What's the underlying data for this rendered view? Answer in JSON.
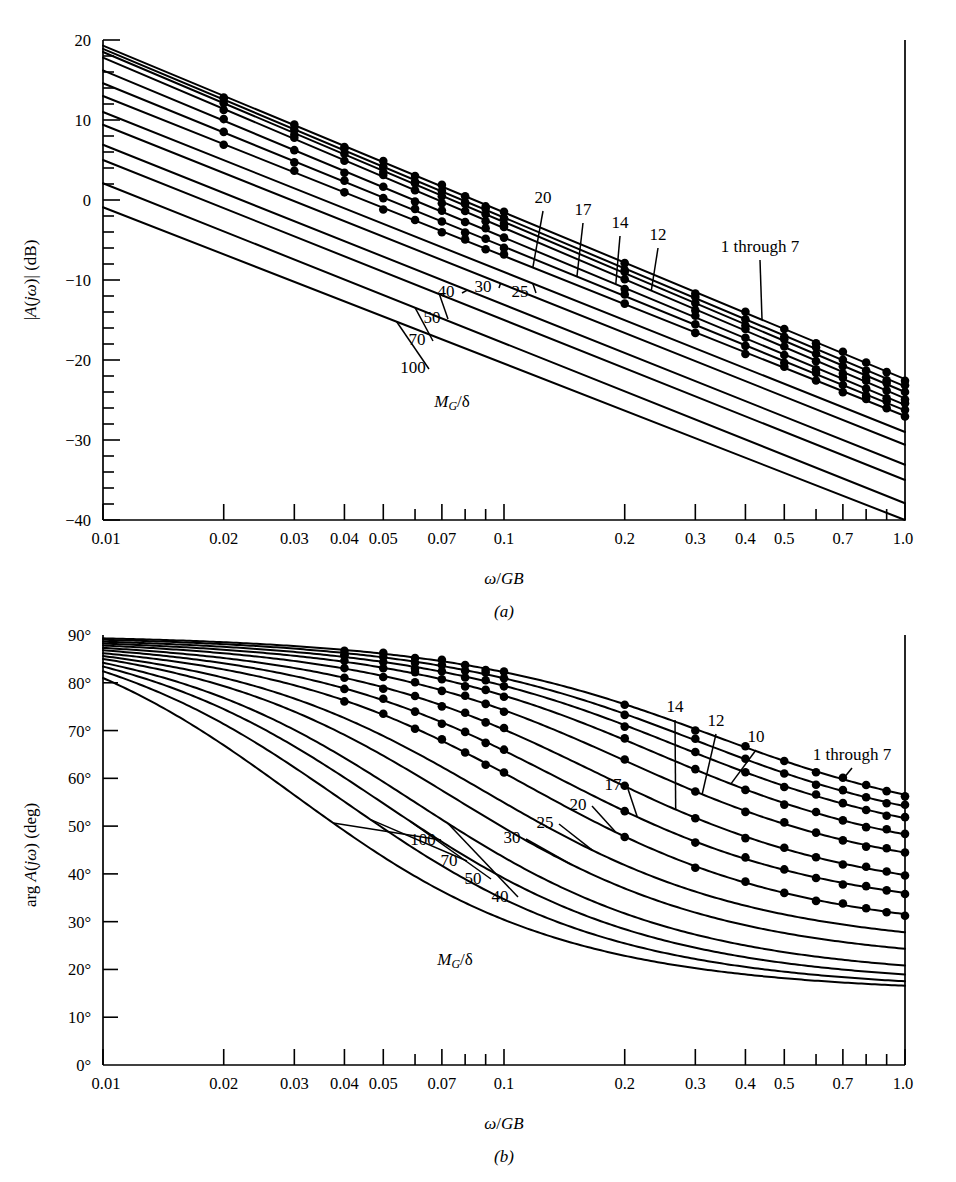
{
  "figure": {
    "panels": [
      {
        "id": "a",
        "caption": "(a)",
        "xlabel": "ω/GB",
        "ylabel": "|A(jω)| (dB)"
      },
      {
        "id": "b",
        "caption": "(b)",
        "xlabel": "ω/GB",
        "ylabel": "arg A(jω) (deg)"
      }
    ],
    "family_label": "M_G/δ",
    "family_label_parts": {
      "m": "M",
      "sub": "G",
      "slash": "/",
      "delta": "δ"
    }
  },
  "chart_data": [
    {
      "type": "line",
      "panel": "a",
      "title": "",
      "xlabel": "ω/GB",
      "ylabel": "|A(jω)| (dB)",
      "xscale": "log",
      "xlim": [
        0.01,
        1.0
      ],
      "ylim": [
        -40,
        20
      ],
      "grid": false,
      "legend": "inline-labels",
      "xticks": [
        0.01,
        0.02,
        0.03,
        0.04,
        0.05,
        0.07,
        0.1,
        0.2,
        0.3,
        0.4,
        0.5,
        0.7,
        1.0
      ],
      "xticklabels": [
        "0.01",
        "0.02",
        "0.03",
        "0.04",
        "0.05",
        "0.07",
        "0.1",
        "0.2",
        "0.3",
        "0.4",
        "0.5",
        "0.7",
        "1.0"
      ],
      "yticks": [
        20,
        10,
        0,
        -10,
        -20,
        -30,
        -40
      ],
      "yticklabels": [
        "20",
        "10",
        "0",
        "−10",
        "−20",
        "−30",
        "−40"
      ],
      "yminor_step": 2,
      "marker": "filled-circle",
      "marker_x": [
        0.02,
        0.03,
        0.04,
        0.05,
        0.06,
        0.07,
        0.08,
        0.09,
        0.1,
        0.2,
        0.3,
        0.4,
        0.5,
        0.6,
        0.7,
        0.8,
        0.9,
        1.0
      ],
      "annotations": [
        {
          "text": "20",
          "target_series": "20"
        },
        {
          "text": "17",
          "target_series": "17"
        },
        {
          "text": "14",
          "target_series": "14"
        },
        {
          "text": "12",
          "target_series": "12"
        },
        {
          "text": "1 through 7",
          "target_series": "1-7"
        },
        {
          "text": "25",
          "target_series": "25"
        },
        {
          "text": "30",
          "target_series": "30"
        },
        {
          "text": "40",
          "target_series": "40"
        },
        {
          "text": "50",
          "target_series": "50"
        },
        {
          "text": "70",
          "target_series": "70"
        },
        {
          "text": "100",
          "target_series": "100"
        },
        {
          "text": "M_G/δ",
          "target_series": null
        }
      ],
      "series": [
        {
          "name": "1-7",
          "y0_db": 19.3,
          "y1_db": -22.4,
          "markers": true
        },
        {
          "name": "1-7b",
          "y0_db": 18.9,
          "y1_db": -23.3,
          "markers": true
        },
        {
          "name": "1-7c",
          "y0_db": 18.5,
          "y1_db": -24.0,
          "markers": true
        },
        {
          "name": "12",
          "y0_db": 17.8,
          "y1_db": -24.8,
          "markers": true
        },
        {
          "name": "14",
          "y0_db": 16.2,
          "y1_db": -25.6,
          "markers": true
        },
        {
          "name": "17",
          "y0_db": 14.6,
          "y1_db": -26.3,
          "markers": true
        },
        {
          "name": "20",
          "y0_db": 13.0,
          "y1_db": -27.0,
          "markers": true
        },
        {
          "name": "25",
          "y0_db": 11.0,
          "y1_db": -29.0,
          "markers": false
        },
        {
          "name": "30",
          "y0_db": 9.4,
          "y1_db": -30.6,
          "markers": false
        },
        {
          "name": "40",
          "y0_db": 6.9,
          "y1_db": -33.1,
          "markers": false
        },
        {
          "name": "50",
          "y0_db": 5.0,
          "y1_db": -35.0,
          "markers": false
        },
        {
          "name": "70",
          "y0_db": 2.1,
          "y1_db": -37.9,
          "markers": false
        },
        {
          "name": "100",
          "y0_db": -0.9,
          "y1_db": -40.0,
          "markers": false
        }
      ]
    },
    {
      "type": "line",
      "panel": "b",
      "title": "",
      "xlabel": "ω/GB",
      "ylabel": "arg A(jω) (deg)",
      "xscale": "log",
      "xlim": [
        0.01,
        1.0
      ],
      "ylim": [
        0,
        90
      ],
      "grid": false,
      "legend": "inline-labels",
      "xticks": [
        0.01,
        0.02,
        0.03,
        0.04,
        0.05,
        0.07,
        0.1,
        0.2,
        0.3,
        0.4,
        0.5,
        0.7,
        1.0
      ],
      "xticklabels": [
        "0.01",
        "0.02",
        "0.03",
        "0.04",
        "0.05",
        "0.07",
        "0.1",
        "0.2",
        "0.3",
        "0.4",
        "0.5",
        "0.7",
        "1.0"
      ],
      "yticks": [
        0,
        10,
        20,
        30,
        40,
        50,
        60,
        70,
        80,
        90
      ],
      "yticklabels": [
        "0°",
        "10°",
        "20°",
        "30°",
        "40°",
        "50°",
        "60°",
        "70°",
        "80°",
        "90°"
      ],
      "marker": "filled-circle",
      "marker_x": [
        0.04,
        0.05,
        0.06,
        0.07,
        0.08,
        0.09,
        0.1,
        0.2,
        0.3,
        0.4,
        0.5,
        0.6,
        0.7,
        0.8,
        0.9,
        1.0
      ],
      "annotations": [
        {
          "text": "14",
          "target_series": "14"
        },
        {
          "text": "12",
          "target_series": "12"
        },
        {
          "text": "10",
          "target_series": "10"
        },
        {
          "text": "1 through 7",
          "target_series": "1-7"
        },
        {
          "text": "17",
          "target_series": "17"
        },
        {
          "text": "20",
          "target_series": "20"
        },
        {
          "text": "25",
          "target_series": "25"
        },
        {
          "text": "30",
          "target_series": "30"
        },
        {
          "text": "40",
          "target_series": "40"
        },
        {
          "text": "50",
          "target_series": "50"
        },
        {
          "text": "70",
          "target_series": "70"
        },
        {
          "text": "100",
          "target_series": "100"
        },
        {
          "text": "M_G/δ",
          "target_series": null
        }
      ],
      "series": [
        {
          "name": "1-7",
          "start_deg": 89.3,
          "corner": 0.33,
          "end_deg": 48.0,
          "markers": true
        },
        {
          "name": "1-7b",
          "start_deg": 89.0,
          "corner": 0.3,
          "end_deg": 46.0,
          "markers": true
        },
        {
          "name": "1-7c",
          "start_deg": 88.6,
          "corner": 0.27,
          "end_deg": 44.0,
          "markers": true
        },
        {
          "name": "10",
          "start_deg": 88.2,
          "corner": 0.24,
          "end_deg": 41.0,
          "markers": true
        },
        {
          "name": "12",
          "start_deg": 87.8,
          "corner": 0.2,
          "end_deg": 38.0,
          "markers": true
        },
        {
          "name": "14",
          "start_deg": 87.3,
          "corner": 0.165,
          "end_deg": 34.0,
          "markers": true
        },
        {
          "name": "17",
          "start_deg": 86.8,
          "corner": 0.135,
          "end_deg": 31.0,
          "markers": true
        },
        {
          "name": "20",
          "start_deg": 86.2,
          "corner": 0.115,
          "end_deg": 27.0,
          "markers": true
        },
        {
          "name": "25",
          "start_deg": 85.6,
          "corner": 0.09,
          "end_deg": 24.0,
          "markers": false
        },
        {
          "name": "30",
          "start_deg": 85.0,
          "corner": 0.075,
          "end_deg": 21.0,
          "markers": false
        },
        {
          "name": "40",
          "start_deg": 84.2,
          "corner": 0.06,
          "end_deg": 18.0,
          "markers": false
        },
        {
          "name": "50",
          "start_deg": 83.4,
          "corner": 0.05,
          "end_deg": 16.5,
          "markers": false
        },
        {
          "name": "70",
          "start_deg": 82.4,
          "corner": 0.04,
          "end_deg": 15.5,
          "markers": false
        },
        {
          "name": "100",
          "start_deg": 81.0,
          "corner": 0.03,
          "end_deg": 15.0,
          "markers": false
        }
      ]
    }
  ]
}
